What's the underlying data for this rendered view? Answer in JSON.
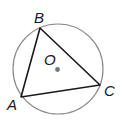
{
  "diagram": {
    "title": "",
    "circle": {
      "cx": 58,
      "cy": 69,
      "r": 45,
      "stroke": "#8a8a8a"
    },
    "center": {
      "label": "O",
      "x": 57,
      "y": 69,
      "dot_color": "#777777"
    },
    "triangle": {
      "stroke": "#1a1a1a",
      "vertices": [
        {
          "label": "A",
          "x": 21,
          "y": 97
        },
        {
          "label": "B",
          "x": 40,
          "y": 28
        },
        {
          "label": "C",
          "x": 100,
          "y": 85
        }
      ]
    },
    "labels": {
      "A": "A",
      "B": "B",
      "C": "C",
      "O": "O"
    }
  }
}
